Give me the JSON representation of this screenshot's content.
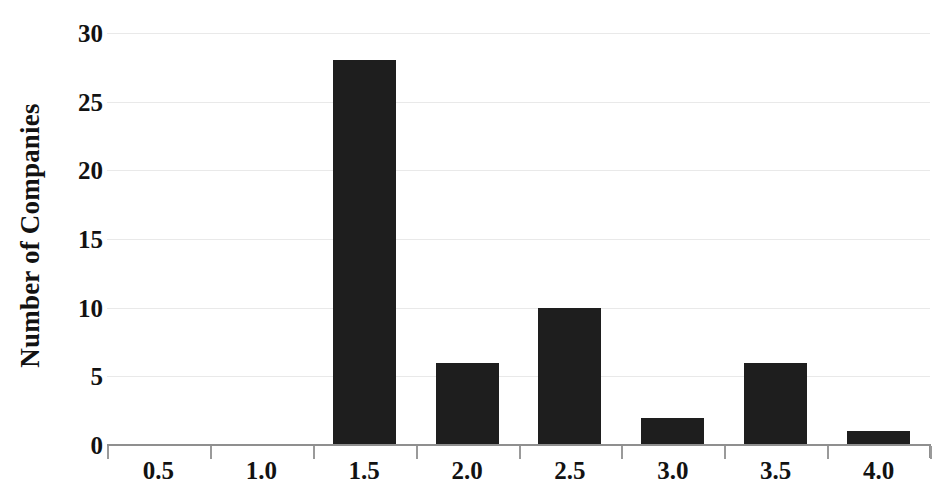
{
  "chart_data": {
    "type": "bar",
    "title": "",
    "subtitle": "",
    "xlabel": "",
    "ylabel": "Number of Companies",
    "categories": [
      "0.5",
      "1.0",
      "1.5",
      "2.0",
      "2.5",
      "3.0",
      "3.5",
      "4.0"
    ],
    "values": [
      0,
      0,
      28,
      6,
      10,
      2,
      6,
      1
    ],
    "series": [
      {
        "name": "Number of Companies",
        "values": [
          0,
          0,
          28,
          6,
          10,
          2,
          6,
          1
        ]
      }
    ],
    "ylim": [
      0,
      30
    ],
    "ytick_labels": [
      "0",
      "5",
      "10",
      "15",
      "20",
      "25",
      "30"
    ],
    "ytick_values": [
      0,
      5,
      10,
      15,
      20,
      25,
      30
    ],
    "xtick_labels": [
      "0.5",
      "1.0",
      "1.5",
      "2.0",
      "2.5",
      "3.0",
      "3.5",
      "4.0"
    ],
    "grid": true,
    "grid_axis": "y",
    "legend": false,
    "legend_position": "none",
    "bar_color": "#1e1e1e",
    "grid_color": "#e9e9e9",
    "axis_color": "#8f8f8f",
    "text_color": "#121212",
    "background_color": "#ffffff",
    "annotations": []
  }
}
